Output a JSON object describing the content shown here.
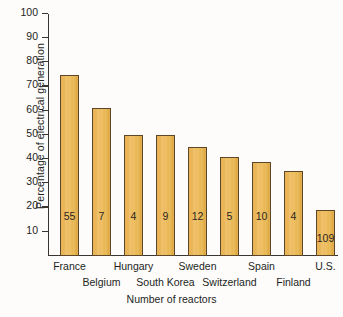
{
  "chart_data": {
    "type": "bar",
    "title": "",
    "xlabel": "Number of reactors",
    "ylabel": "Percentage of electrical generation",
    "ylim": [
      0,
      100
    ],
    "yticks": [
      10,
      20,
      30,
      40,
      50,
      60,
      70,
      80,
      90,
      100
    ],
    "grid": false,
    "legend": null,
    "categories": [
      "France",
      "Belgium",
      "Hungary",
      "South Korea",
      "Sweden",
      "Switzerland",
      "Spain",
      "Finland",
      "U.S."
    ],
    "values": [
      75,
      61,
      50,
      50,
      45,
      41,
      39,
      35,
      19
    ],
    "bar_labels": [
      "55",
      "7",
      "4",
      "9",
      "12",
      "5",
      "10",
      "4",
      "109"
    ],
    "label_rows": [
      0,
      1,
      0,
      1,
      0,
      1,
      0,
      1,
      0
    ],
    "series": [
      {
        "name": "Percentage of electrical generation",
        "values": [
          75,
          61,
          50,
          50,
          45,
          41,
          39,
          35,
          19
        ]
      },
      {
        "name": "Number of reactors",
        "values": [
          55,
          7,
          4,
          9,
          12,
          5,
          10,
          4,
          109
        ]
      }
    ],
    "colors": {
      "bar_fill": "#eab955",
      "bar_edge": "#5e4726",
      "axis": "#3a3430",
      "text": "#231f1c",
      "background": "#fdfcfa"
    }
  }
}
